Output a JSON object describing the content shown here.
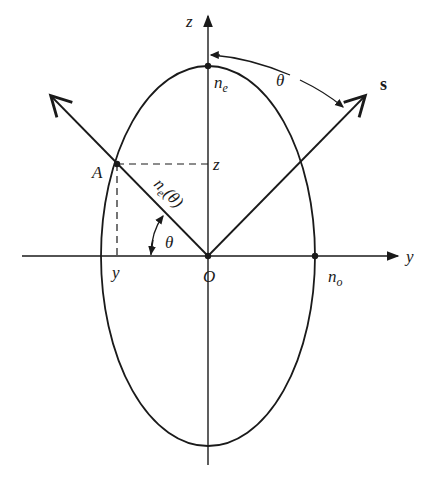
{
  "figure": {
    "axes": {
      "z_label": "z",
      "y_label": "y",
      "origin_label": "O"
    },
    "points": {
      "A_label": "A",
      "ne_label": "n",
      "ne_sub": "e",
      "no_label": "n",
      "no_sub": "o",
      "z_proj_label": "z",
      "y_proj_label": "y"
    },
    "vectors": {
      "s_label": "s",
      "ne_theta_label_main": "n",
      "ne_theta_label_sub": "e",
      "ne_theta_label_arg": "(θ)"
    },
    "angles": {
      "theta_top": "θ",
      "theta_bottom": "θ"
    },
    "colors": {
      "stroke": "#1a1a1a",
      "background": "#ffffff"
    }
  }
}
